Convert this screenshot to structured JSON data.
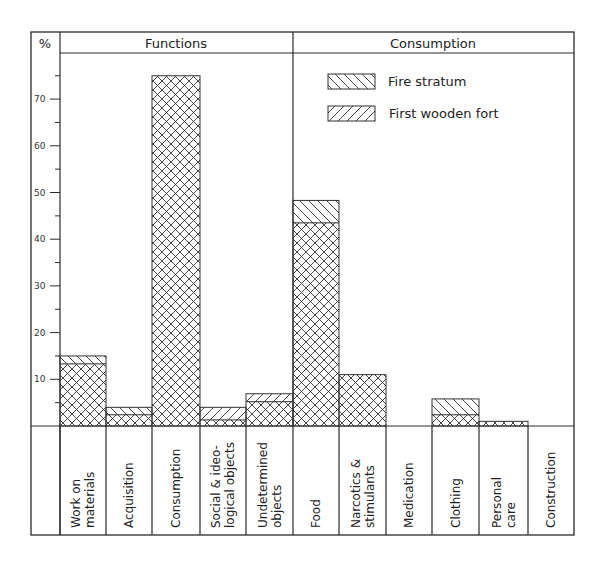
{
  "header": {
    "y_unit": "%",
    "group_left": "Functions",
    "group_right": "Consumption"
  },
  "legend": [
    {
      "name": "Fire stratum",
      "pattern": "backslash-hatch"
    },
    {
      "name": "First wooden fort",
      "pattern": "slash-hatch"
    }
  ],
  "chart_data": {
    "type": "bar",
    "title": "",
    "xlabel": "",
    "ylabel": "%",
    "ylim": [
      0,
      78
    ],
    "yticks_labeled": [
      10,
      20,
      30,
      40,
      50,
      60,
      70
    ],
    "yticks_minor": [
      5,
      15,
      25,
      35,
      45,
      55,
      65,
      75
    ],
    "grid": false,
    "legend_position": "upper right (inside Consumption panel)",
    "overlap_note": "Series are overlaid; the overlapping region renders as crosshatch.",
    "groups": [
      {
        "name": "Functions",
        "categories": [
          "Work on materials",
          "Acquisition",
          "Consumption",
          "Social & ideological objects",
          "Undetermined objects"
        ]
      },
      {
        "name": "Consumption",
        "categories": [
          "Food",
          "Narcotics & stimulants",
          "Medication",
          "Clothing",
          "Personal care",
          "Construction"
        ]
      }
    ],
    "categories": [
      "Work on materials",
      "Acquisition",
      "Consumption",
      "Social & ideological objects",
      "Undetermined objects",
      "Food",
      "Narcotics & stimulants",
      "Medication",
      "Clothing",
      "Personal care",
      "Construction"
    ],
    "category_label_lines": [
      [
        "Work on",
        "materials"
      ],
      [
        "Acquisition"
      ],
      [
        "Consumption"
      ],
      [
        "Social & ideo-",
        "logical objects"
      ],
      [
        "Undetermined",
        "objects"
      ],
      [
        "Food"
      ],
      [
        "Narcotics &",
        "stimulants"
      ],
      [
        "Medication"
      ],
      [
        "Clothing"
      ],
      [
        "Personal",
        "care"
      ],
      [
        "Construction"
      ]
    ],
    "series": [
      {
        "name": "Fire stratum",
        "values": [
          15,
          4,
          75,
          1.3,
          5.2,
          48.3,
          11,
          0,
          5.8,
          1,
          0
        ]
      },
      {
        "name": "First wooden fort",
        "values": [
          13.3,
          2.4,
          75,
          4,
          6.9,
          43.5,
          11,
          0,
          2.4,
          1,
          0
        ]
      }
    ]
  }
}
